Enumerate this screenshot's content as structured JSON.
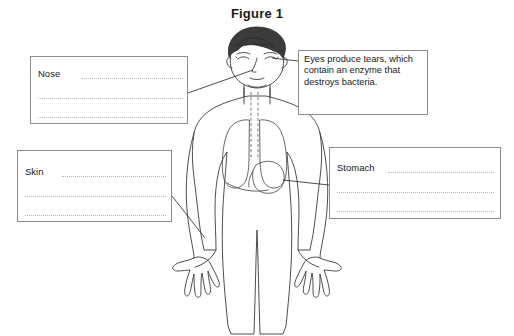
{
  "figure": {
    "title": "Figure 1"
  },
  "callouts": {
    "eyes": {
      "label": "eyes-fact",
      "text": "Eyes produce tears, which contain an enzyme that destroys bacteria."
    }
  },
  "answer_boxes": [
    {
      "id": "nose",
      "label": "Nose",
      "blank_lines": 3
    },
    {
      "id": "skin",
      "label": "Skin",
      "blank_lines": 3
    },
    {
      "id": "stomach",
      "label": "Stomach",
      "blank_lines": 3
    }
  ],
  "colors": {
    "page_background": "#ffffff",
    "box_border": "#8d8d8d",
    "writing_line": "#b9b9b9",
    "body_outline": "#3a3a3a",
    "hair": "#3b3b3b",
    "text": "#1a1a1a",
    "leader_line": "#2e2e2e"
  },
  "diagram_parts": [
    "head",
    "hair",
    "eyes",
    "nose",
    "mouth",
    "neck",
    "trachea",
    "left-lung",
    "right-lung",
    "stomach",
    "torso",
    "arms",
    "hands",
    "legs"
  ]
}
